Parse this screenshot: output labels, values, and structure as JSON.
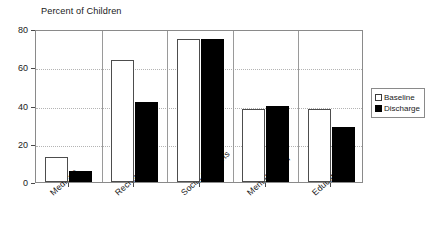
{
  "chart_data": {
    "type": "bar",
    "title": "Percent of Children",
    "xlabel": "",
    "ylabel": "Percent of Children",
    "ylim": [
      0,
      80
    ],
    "yticks": [
      0,
      20,
      40,
      60,
      80
    ],
    "grid": true,
    "legend_position": "right",
    "categories": [
      "Medical*",
      "Recreation**",
      "Social Supports",
      "Mental Health",
      "Education*"
    ],
    "series": [
      {
        "name": "Baseline",
        "color": "#ffffff",
        "edge_color": "#4d4d4d",
        "values": [
          13,
          64,
          75,
          38,
          38
        ]
      },
      {
        "name": "Discharge",
        "color": "#000000",
        "edge_color": "#000000",
        "values": [
          6,
          42,
          75,
          40,
          29
        ]
      }
    ]
  },
  "axis": {
    "caption": "Percent of Children",
    "ytick_labels": [
      "80",
      "60",
      "40",
      "20",
      "0"
    ]
  },
  "legend": {
    "items": [
      {
        "label": "Baseline",
        "swatch": "white-square-swatch"
      },
      {
        "label": "Discharge",
        "swatch": "black-square-swatch"
      }
    ]
  }
}
